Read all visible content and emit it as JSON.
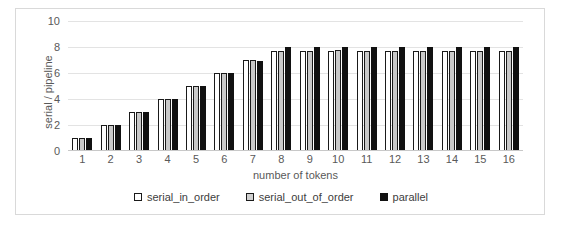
{
  "chart_data": {
    "type": "bar",
    "title": "",
    "xlabel": "number of tokens",
    "ylabel": "serial / pipeline",
    "categories": [
      "1",
      "2",
      "3",
      "4",
      "5",
      "6",
      "7",
      "8",
      "9",
      "10",
      "11",
      "12",
      "13",
      "14",
      "15",
      "16"
    ],
    "ylim": [
      0,
      10
    ],
    "yticks": [
      10,
      8,
      6,
      4,
      2,
      0
    ],
    "grid": true,
    "legend_position": "bottom",
    "series": [
      {
        "name": "serial_in_order",
        "color": "#ffffff",
        "values": [
          1.0,
          2.0,
          3.0,
          4.0,
          5.0,
          6.0,
          7.0,
          7.7,
          7.7,
          7.7,
          7.7,
          7.7,
          7.7,
          7.7,
          7.7,
          7.7
        ]
      },
      {
        "name": "serial_out_of_order",
        "color": "#c9c9c9",
        "values": [
          1.0,
          2.0,
          3.0,
          4.0,
          5.0,
          6.0,
          7.0,
          7.7,
          7.7,
          7.8,
          7.7,
          7.7,
          7.7,
          7.7,
          7.7,
          7.7
        ]
      },
      {
        "name": "parallel",
        "color": "#111111",
        "values": [
          1.0,
          2.0,
          3.0,
          4.0,
          5.0,
          6.0,
          6.9,
          8.0,
          8.0,
          8.0,
          8.0,
          8.0,
          8.0,
          8.0,
          8.0,
          8.0
        ]
      }
    ]
  }
}
